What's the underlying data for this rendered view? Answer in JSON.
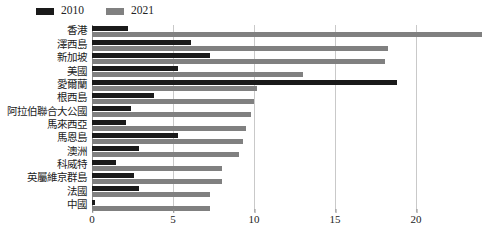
{
  "chart_data": {
    "type": "bar",
    "orientation": "horizontal",
    "title": "",
    "xlabel": "",
    "ylabel": "",
    "xlim": [
      0,
      20
    ],
    "xticks": [
      0,
      5,
      10,
      15,
      20
    ],
    "grid": true,
    "legend_position": "top-left",
    "categories": [
      "香港",
      "澤西島",
      "新加坡",
      "美國",
      "愛爾蘭",
      "根西島",
      "阿拉伯聯合大公國",
      "馬來西亞",
      "馬恩島",
      "澳洲",
      "科威特",
      "英屬維京群島",
      "法國",
      "中國"
    ],
    "series": [
      {
        "name": "2010",
        "color": "#1a1a1a",
        "values": [
          2.2,
          6.1,
          7.3,
          5.3,
          18.8,
          3.8,
          2.4,
          2.1,
          5.3,
          2.9,
          1.5,
          2.6,
          2.9,
          0.2
        ]
      },
      {
        "name": "2021",
        "color": "#808080",
        "values": [
          24.1,
          18.3,
          18.1,
          13.0,
          10.2,
          10.0,
          9.8,
          9.5,
          9.3,
          9.1,
          8.0,
          8.0,
          7.3,
          7.3
        ]
      }
    ]
  }
}
